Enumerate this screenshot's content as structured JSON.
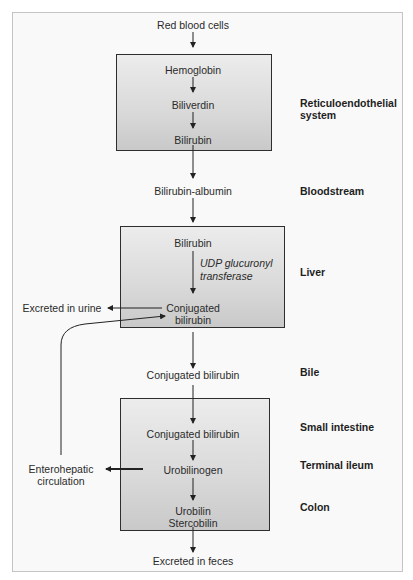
{
  "flow": {
    "start": "Red blood cells",
    "box_reticuloendothelial": {
      "items": [
        "Hemoglobin",
        "Biliverdin",
        "Bilirubin"
      ]
    },
    "bloodstream_node": "Bilirubin-albumin",
    "box_liver": {
      "top": "Bilirubin",
      "enzyme_line1": "UDP glucuronyl",
      "enzyme_line2": "transferase",
      "bottom_line1": "Conjugated",
      "bottom_line2": "bilirubin"
    },
    "urine_output": "Excreted in urine",
    "bile_node": "Conjugated bilirubin",
    "box_intestine": {
      "items": [
        "Conjugated bilirubin",
        "Urobilinogen"
      ],
      "final_line1": "Urobilin",
      "final_line2": "Stercobilin"
    },
    "enterohepatic_line1": "Enterohepatic",
    "enterohepatic_line2": "circulation",
    "end": "Excreted in feces"
  },
  "location_labels": {
    "reticuloendothelial_line1": "Reticuloendothelial",
    "reticuloendothelial_line2": "system",
    "bloodstream": "Bloodstream",
    "liver": "Liver",
    "bile": "Bile",
    "small_intestine": "Small intestine",
    "terminal_ileum": "Terminal ileum",
    "colon": "Colon"
  },
  "colors": {
    "frame_border": "#c4c4c4",
    "frame_bg": "#f9f9f9",
    "box_border": "#2e2e2e",
    "box_gradient_top": "#ececec",
    "box_gradient_bottom": "#c9c9c9",
    "arrow": "#222222"
  }
}
